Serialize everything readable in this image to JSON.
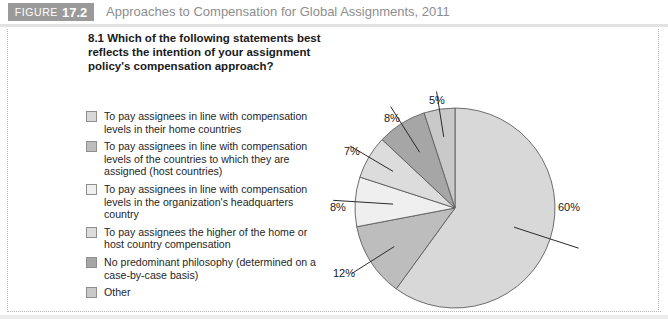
{
  "header": {
    "tag_word": "FIGURE",
    "tag_number": "17.2",
    "title": "Approaches to Compensation for Global Assignments, 2011"
  },
  "question": "8.1 Which of the following statements best reflects the intention of your assignment policy's compensation approach?",
  "legend": {
    "items": [
      {
        "label": "To pay assignees in line with compensation levels in their home countries",
        "color": "#d8d8d8"
      },
      {
        "label": "To pay assignees in line with compensation levels of the countries to which they are assigned (host countries)",
        "color": "#bdbdbd"
      },
      {
        "label": "To pay assignees in line with compensation levels in the organization's headquarters country",
        "color": "#efefef"
      },
      {
        "label": "To pay assignees the higher of the home or host country compensation",
        "color": "#dcdcdc"
      },
      {
        "label": "No predominant philosophy (determined on a case-by-case basis)",
        "color": "#a6a6a6"
      },
      {
        "label": "Other",
        "color": "#c9c9c9"
      }
    ]
  },
  "chart_data": {
    "type": "pie",
    "title": "8.1 Which of the following statements best reflects the intention of your assignment policy's compensation approach?",
    "unit": "%",
    "legend_position": "left",
    "categories": [
      "To pay assignees in line with compensation levels in their home countries",
      "To pay assignees in line with compensation levels of the countries to which they are assigned (host countries)",
      "To pay assignees in line with compensation levels in the organization's headquarters country",
      "To pay assignees the higher of the home or host country compensation",
      "No predominant philosophy (determined on a case-by-case basis)",
      "Other"
    ],
    "values": [
      60,
      12,
      8,
      7,
      8,
      5
    ],
    "labels": [
      "60%",
      "12%",
      "8%",
      "7%",
      "8%",
      "5%"
    ],
    "colors": [
      "#d8d8d8",
      "#bdbdbd",
      "#efefef",
      "#dcdcdc",
      "#a6a6a6",
      "#c9c9c9"
    ]
  }
}
